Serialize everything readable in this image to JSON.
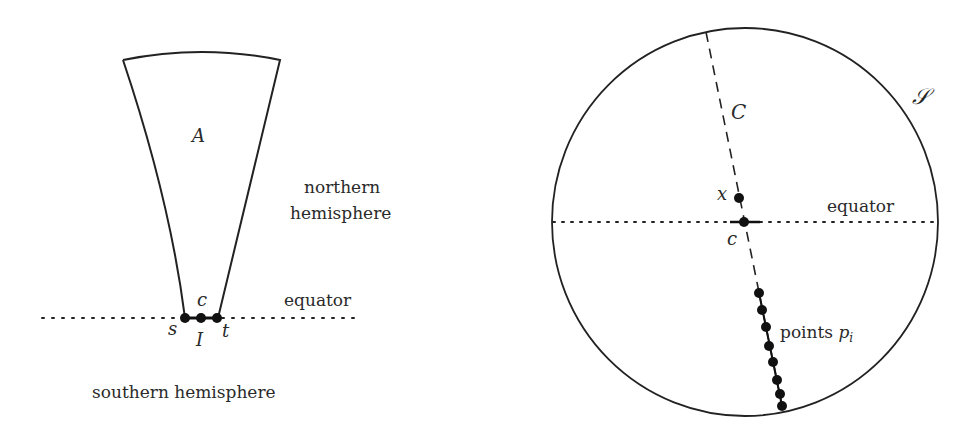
{
  "left_panel": {
    "region_label": "A",
    "northern_label_line1": "northern",
    "northern_label_line2": "hemisphere",
    "equator_label": "equator",
    "southern_label": "southern hemisphere",
    "point_labels": {
      "s": "s",
      "c": "c",
      "t": "t"
    },
    "interval_label": "I"
  },
  "right_panel": {
    "sphere_label": "𝒮",
    "curve_label": "C",
    "equator_label": "equator",
    "point_x_label": "x",
    "point_c_label": "c",
    "points_label_text": "points ",
    "points_label_var": "p",
    "points_label_sub": "i",
    "points_count": 8
  },
  "colors": {
    "stroke": "#222222",
    "text": "#2a2a2a",
    "background": "#ffffff"
  }
}
